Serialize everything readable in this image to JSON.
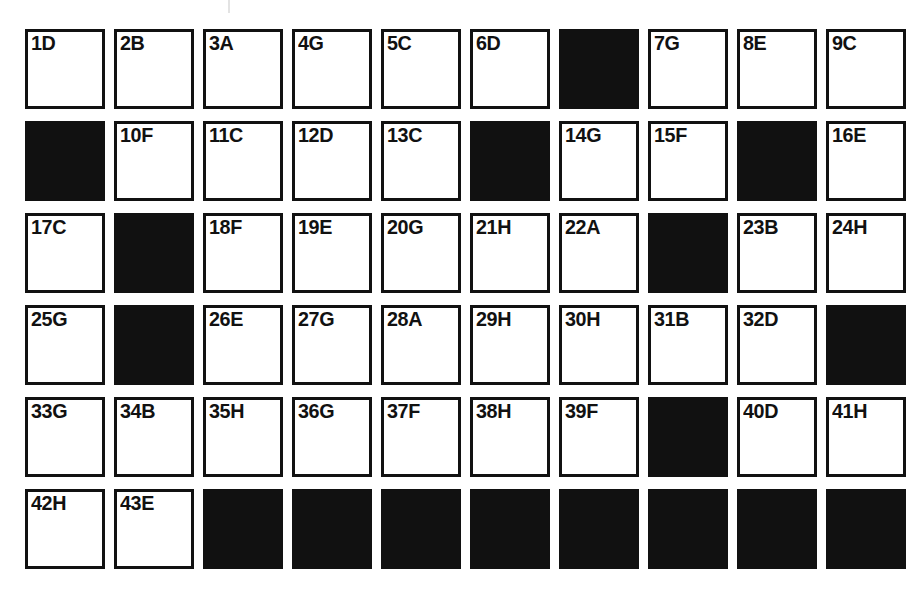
{
  "page": {
    "background_color": "#ffffff",
    "ink_color": "#111111",
    "columns": 10,
    "rows": 6,
    "tick_mark": {
      "name": "registration-tick",
      "color": "#e3e3e3"
    }
  },
  "grid": {
    "cells": [
      {
        "label": "1D",
        "state": "open",
        "row": 1,
        "col": 1
      },
      {
        "label": "2B",
        "state": "open",
        "row": 1,
        "col": 2
      },
      {
        "label": "3A",
        "state": "open",
        "row": 1,
        "col": 3
      },
      {
        "label": "4G",
        "state": "open",
        "row": 1,
        "col": 4
      },
      {
        "label": "5C",
        "state": "open",
        "row": 1,
        "col": 5
      },
      {
        "label": "6D",
        "state": "open",
        "row": 1,
        "col": 6
      },
      {
        "label": "",
        "state": "filled",
        "row": 1,
        "col": 7
      },
      {
        "label": "7G",
        "state": "open",
        "row": 1,
        "col": 8
      },
      {
        "label": "8E",
        "state": "open",
        "row": 1,
        "col": 9
      },
      {
        "label": "9C",
        "state": "open",
        "row": 1,
        "col": 10
      },
      {
        "label": "",
        "state": "filled",
        "row": 2,
        "col": 1
      },
      {
        "label": "10F",
        "state": "open",
        "row": 2,
        "col": 2
      },
      {
        "label": "11C",
        "state": "open",
        "row": 2,
        "col": 3
      },
      {
        "label": "12D",
        "state": "open",
        "row": 2,
        "col": 4
      },
      {
        "label": "13C",
        "state": "open",
        "row": 2,
        "col": 5
      },
      {
        "label": "",
        "state": "filled",
        "row": 2,
        "col": 6
      },
      {
        "label": "14G",
        "state": "open",
        "row": 2,
        "col": 7
      },
      {
        "label": "15F",
        "state": "open",
        "row": 2,
        "col": 8
      },
      {
        "label": "",
        "state": "filled",
        "row": 2,
        "col": 9
      },
      {
        "label": "16E",
        "state": "open",
        "row": 2,
        "col": 10
      },
      {
        "label": "17C",
        "state": "open",
        "row": 3,
        "col": 1
      },
      {
        "label": "",
        "state": "filled",
        "row": 3,
        "col": 2
      },
      {
        "label": "18F",
        "state": "open",
        "row": 3,
        "col": 3
      },
      {
        "label": "19E",
        "state": "open",
        "row": 3,
        "col": 4
      },
      {
        "label": "20G",
        "state": "open",
        "row": 3,
        "col": 5
      },
      {
        "label": "21H",
        "state": "open",
        "row": 3,
        "col": 6
      },
      {
        "label": "22A",
        "state": "open",
        "row": 3,
        "col": 7
      },
      {
        "label": "",
        "state": "filled",
        "row": 3,
        "col": 8
      },
      {
        "label": "23B",
        "state": "open",
        "row": 3,
        "col": 9
      },
      {
        "label": "24H",
        "state": "open",
        "row": 3,
        "col": 10
      },
      {
        "label": "25G",
        "state": "open",
        "row": 4,
        "col": 1
      },
      {
        "label": "",
        "state": "filled",
        "row": 4,
        "col": 2
      },
      {
        "label": "26E",
        "state": "open",
        "row": 4,
        "col": 3
      },
      {
        "label": "27G",
        "state": "open",
        "row": 4,
        "col": 4
      },
      {
        "label": "28A",
        "state": "open",
        "row": 4,
        "col": 5
      },
      {
        "label": "29H",
        "state": "open",
        "row": 4,
        "col": 6
      },
      {
        "label": "30H",
        "state": "open",
        "row": 4,
        "col": 7
      },
      {
        "label": "31B",
        "state": "open",
        "row": 4,
        "col": 8
      },
      {
        "label": "32D",
        "state": "open",
        "row": 4,
        "col": 9
      },
      {
        "label": "",
        "state": "filled",
        "row": 4,
        "col": 10
      },
      {
        "label": "33G",
        "state": "open",
        "row": 5,
        "col": 1
      },
      {
        "label": "34B",
        "state": "open",
        "row": 5,
        "col": 2
      },
      {
        "label": "35H",
        "state": "open",
        "row": 5,
        "col": 3
      },
      {
        "label": "36G",
        "state": "open",
        "row": 5,
        "col": 4
      },
      {
        "label": "37F",
        "state": "open",
        "row": 5,
        "col": 5
      },
      {
        "label": "38H",
        "state": "open",
        "row": 5,
        "col": 6
      },
      {
        "label": "39F",
        "state": "open",
        "row": 5,
        "col": 7
      },
      {
        "label": "",
        "state": "filled",
        "row": 5,
        "col": 8
      },
      {
        "label": "40D",
        "state": "open",
        "row": 5,
        "col": 9
      },
      {
        "label": "41H",
        "state": "open",
        "row": 5,
        "col": 10
      },
      {
        "label": "42H",
        "state": "open",
        "row": 6,
        "col": 1
      },
      {
        "label": "43E",
        "state": "open",
        "row": 6,
        "col": 2
      },
      {
        "label": "",
        "state": "filled",
        "row": 6,
        "col": 3
      },
      {
        "label": "",
        "state": "filled",
        "row": 6,
        "col": 4
      },
      {
        "label": "",
        "state": "filled",
        "row": 6,
        "col": 5
      },
      {
        "label": "",
        "state": "filled",
        "row": 6,
        "col": 6
      },
      {
        "label": "",
        "state": "filled",
        "row": 6,
        "col": 7
      },
      {
        "label": "",
        "state": "filled",
        "row": 6,
        "col": 8
      },
      {
        "label": "",
        "state": "filled",
        "row": 6,
        "col": 9
      },
      {
        "label": "",
        "state": "filled",
        "row": 6,
        "col": 10
      }
    ]
  }
}
